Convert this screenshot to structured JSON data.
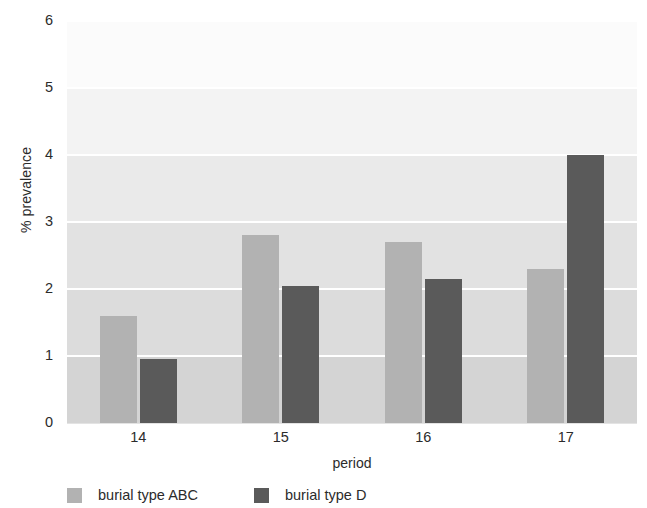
{
  "chart_data": {
    "type": "bar",
    "title": "",
    "xlabel": "period",
    "ylabel": "% prevalence",
    "categories": [
      "14",
      "15",
      "16",
      "17"
    ],
    "series": [
      {
        "name": "burial type ABC",
        "color": "#b2b2b2",
        "values": [
          1.6,
          2.8,
          2.7,
          2.3
        ]
      },
      {
        "name": "burial type D",
        "color": "#5a5a5a",
        "values": [
          0.95,
          2.05,
          2.15,
          4.0
        ]
      }
    ],
    "ylim": [
      0,
      6
    ],
    "yticks": [
      0,
      1,
      2,
      3,
      4,
      5,
      6
    ],
    "ytick_labels": [
      "0",
      "1",
      "2",
      "3",
      "4",
      "5",
      "6"
    ],
    "grid": true,
    "grid_orientation": "horizontal",
    "legend_position": "bottom-left",
    "background_bands": [
      "#fbfbfb",
      "#f3f3f3",
      "#eaeaea",
      "#e2e2e2",
      "#dcdcdc",
      "#d4d4d4"
    ]
  }
}
